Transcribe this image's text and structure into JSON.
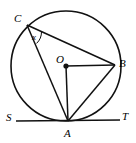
{
  "figure": {
    "type": "circle-geometry-diagram",
    "width": 136,
    "height": 143,
    "background_color": "#ffffff",
    "stroke_color": "#000000"
  },
  "points": {
    "C": {
      "label": "C",
      "x": 27,
      "y": 25,
      "on_circle": true
    },
    "B": {
      "label": "B",
      "x": 115,
      "y": 65,
      "on_circle": true
    },
    "O": {
      "label": "O",
      "x": 66,
      "y": 66,
      "on_circle": false,
      "is_center": true,
      "marker": "filled-dot"
    },
    "A": {
      "label": "A",
      "x": 68,
      "y": 121,
      "on_circle": true
    },
    "S": {
      "label": "S",
      "x": 18,
      "y": 120,
      "on_circle": false
    },
    "T": {
      "label": "T",
      "x": 122,
      "y": 119,
      "on_circle": false
    }
  },
  "circle": {
    "center_x": 66,
    "center_y": 66,
    "radius": 55
  },
  "segments": [
    {
      "name": "chord-CB",
      "from": "C",
      "to": "B"
    },
    {
      "name": "chord-CA",
      "from": "C",
      "to": "A"
    },
    {
      "name": "chord-AB",
      "from": "A",
      "to": "B"
    },
    {
      "name": "radius-OA",
      "from": "O",
      "to": "A"
    },
    {
      "name": "radius-OB",
      "from": "O",
      "to": "B"
    },
    {
      "name": "tangent-ST",
      "from": "S",
      "to": "T"
    }
  ],
  "angles": [
    {
      "name": "angle-at-C",
      "label": "x",
      "vertex": "C",
      "rays": [
        "CB",
        "CA"
      ]
    }
  ]
}
